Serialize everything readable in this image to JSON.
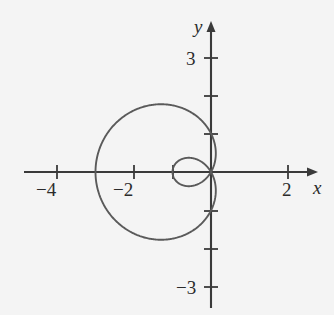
{
  "figure": {
    "background_color": "#f4f4f4",
    "curve_color": "#5a5a5a",
    "axis_color": "#3a3a3a",
    "text_color": "#2b2b2b"
  },
  "axes": {
    "x_axis_label": "x",
    "y_axis_label": "y",
    "x_label_text": "x",
    "y_label_text": "y",
    "x_ticks": [
      {
        "value": -4,
        "label": "−4",
        "px": 57
      },
      {
        "value": -3,
        "label": "",
        "px": 96
      },
      {
        "value": -2,
        "label": "−2",
        "px": 134
      },
      {
        "value": -1,
        "label": "",
        "px": 173
      },
      {
        "value": 1,
        "label": "",
        "px": 250
      },
      {
        "value": 2,
        "label": "2",
        "px": 288
      }
    ],
    "y_ticks": [
      {
        "value": 3,
        "label": "3",
        "px": 58
      },
      {
        "value": 2,
        "label": "",
        "px": 96
      },
      {
        "value": 1,
        "label": "",
        "px": 134
      },
      {
        "value": -1,
        "label": "",
        "px": 211
      },
      {
        "value": -2,
        "label": "",
        "px": 249
      },
      {
        "value": -3,
        "label": "−3",
        "px": 287
      }
    ],
    "origin_px": {
      "x": 211,
      "y": 172
    },
    "unit_px": 38.5,
    "x_range": [
      -4.9,
      2.8
    ],
    "y_range": [
      -3.6,
      3.1
    ]
  },
  "chart_data": {
    "type": "line",
    "title": "",
    "xlabel": "x",
    "ylabel": "y",
    "xlim": [
      -4.9,
      2.8
    ],
    "ylim": [
      -3.6,
      3.1
    ],
    "grid": false,
    "legend": "none",
    "coordinate_system": "polar",
    "curve_name": "limacon-with-inner-loop",
    "equation": "r = 1 + 2 cos(theta), reflected about the y-axis",
    "annotations": [],
    "key_points": [
      {
        "label": "outer loop left x-intercept",
        "x": -3,
        "y": 0
      },
      {
        "label": "outer loop top y-intercept",
        "x": 0,
        "y": 2
      },
      {
        "label": "outer loop bottom y-intercept",
        "x": 0,
        "y": -2
      },
      {
        "label": "common right point / inner loop right x-intercept",
        "x": 1,
        "y": 0
      },
      {
        "label": "inner loop left x-intercept (pole)",
        "x": 0,
        "y": 0
      }
    ],
    "series": [
      {
        "name": "outer loop",
        "x": [
          1.0,
          0.95,
          0.8,
          0.56,
          0.24,
          -0.14,
          -0.55,
          -0.98,
          -1.4,
          -1.79,
          -2.14,
          -2.44,
          -2.68,
          -2.85,
          -2.96,
          -3.0,
          -2.96,
          -2.85,
          -2.68,
          -2.44,
          -2.14,
          -1.79,
          -1.4,
          -0.98,
          -0.55,
          -0.14,
          0.24,
          0.56,
          0.8,
          0.95,
          1.0
        ],
        "y": [
          0.0,
          0.31,
          0.6,
          0.87,
          1.1,
          1.3,
          1.47,
          1.6,
          1.71,
          1.78,
          1.82,
          1.82,
          1.77,
          1.66,
          1.45,
          0.0,
          -1.45,
          -1.66,
          -1.77,
          -1.82,
          -1.82,
          -1.78,
          -1.71,
          -1.6,
          -1.47,
          -1.3,
          -1.1,
          -0.87,
          -0.6,
          -0.31,
          0.0
        ]
      },
      {
        "name": "inner loop",
        "x": [
          1.0,
          0.97,
          0.88,
          0.75,
          0.59,
          0.41,
          0.25,
          0.11,
          0.02,
          0.0,
          0.02,
          0.11,
          0.25,
          0.41,
          0.59,
          0.75,
          0.88,
          0.97,
          1.0
        ],
        "y": [
          0.0,
          0.17,
          0.32,
          0.44,
          0.5,
          0.51,
          0.46,
          0.35,
          0.2,
          0.0,
          -0.2,
          -0.35,
          -0.46,
          -0.51,
          -0.5,
          -0.44,
          -0.32,
          -0.17,
          0.0
        ]
      }
    ]
  }
}
